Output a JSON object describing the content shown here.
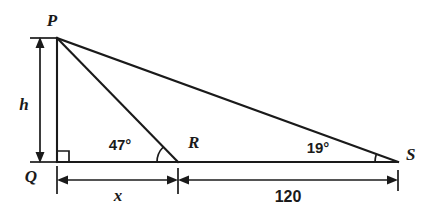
{
  "figure": {
    "type": "geometry-diagram",
    "background_color": "#ffffff",
    "ink_color": "#1a1a1a"
  },
  "vertices": [
    {
      "name": "P",
      "label": "P",
      "x": 57,
      "y": 38,
      "label_x": 52,
      "label_y": 26
    },
    {
      "name": "Q",
      "label": "Q",
      "x": 57,
      "y": 162,
      "label_x": 31,
      "label_y": 182
    },
    {
      "name": "R",
      "label": "R",
      "x": 178,
      "y": 162,
      "label_x": 188,
      "label_y": 148
    },
    {
      "name": "S",
      "label": "S",
      "x": 398,
      "y": 162,
      "label_x": 406,
      "label_y": 160
    }
  ],
  "segments": [
    {
      "name": "segment-PQ",
      "x1": 57,
      "y1": 38,
      "x2": 57,
      "y2": 162
    },
    {
      "name": "segment-QS",
      "x1": 57,
      "y1": 162,
      "x2": 398,
      "y2": 162
    },
    {
      "name": "segment-PR",
      "x1": 57,
      "y1": 38,
      "x2": 178,
      "y2": 162
    },
    {
      "name": "segment-PS",
      "x1": 57,
      "y1": 38,
      "x2": 398,
      "y2": 162
    }
  ],
  "right_angle": {
    "name": "right-angle-marker-Q",
    "at_vertex": "Q",
    "x": 58,
    "y": 151,
    "size": 11
  },
  "angles": [
    {
      "name": "angle-at-R",
      "value": "47°",
      "at_vertex": "R",
      "radius": 21,
      "label_x": 120,
      "label_y": 150
    },
    {
      "name": "angle-at-S",
      "value": "19°",
      "at_vertex": "S",
      "radius": 23,
      "label_x": 307,
      "label_y": 153
    }
  ],
  "dimensions": [
    {
      "name": "dimension-height-h",
      "label": "h",
      "orientation": "vertical",
      "line_x": 40,
      "y_start": 38,
      "y_end": 162,
      "tick_x1": 30,
      "tick_x2": 57,
      "label_x": 24,
      "label_y": 110
    },
    {
      "name": "dimension-x",
      "label": "x",
      "orientation": "horizontal",
      "line_y": 180,
      "x_start": 57,
      "x_end": 178,
      "label_x": 113,
      "label_y": 201
    },
    {
      "name": "dimension-120",
      "label": "120",
      "orientation": "horizontal",
      "line_y": 180,
      "x_start": 178,
      "x_end": 398,
      "label_x": 272,
      "label_y": 202
    }
  ],
  "extension_ticks": [
    {
      "name": "extension-tick-Q",
      "x": 57,
      "y1": 166,
      "y2": 194
    },
    {
      "name": "extension-tick-R",
      "x": 178,
      "y1": 168,
      "y2": 194
    },
    {
      "name": "extension-tick-S",
      "x": 398,
      "y1": 170,
      "y2": 191
    }
  ]
}
